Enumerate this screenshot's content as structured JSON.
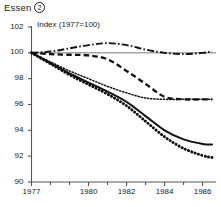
{
  "header": {
    "title": "Essen",
    "marker": "2"
  },
  "axis_note": "Index (1977=100)",
  "chart_data": {
    "type": "line",
    "title": "Essen",
    "subtitle": "Index (1977=100)",
    "xlabel": "",
    "ylabel": "Index (1977=100)",
    "xlim": [
      1977,
      1986.6
    ],
    "ylim": [
      90,
      102
    ],
    "yticks": [
      90,
      92,
      94,
      96,
      98,
      100,
      102
    ],
    "ytick_labels": [
      "90",
      "92",
      "94",
      "96",
      "98",
      "100",
      "102"
    ],
    "xticks": [
      1977,
      1978,
      1979,
      1980,
      1981,
      1982,
      1983,
      1984,
      1985,
      1986
    ],
    "xtick_labels": [
      "1977",
      "",
      "",
      "1980",
      "",
      "1982",
      "",
      "1984",
      "",
      "1986"
    ],
    "grid": false,
    "legend": "none",
    "reference_line": 100,
    "x": [
      1977,
      1978,
      1979,
      1980,
      1981,
      1982,
      1983,
      1984,
      1985,
      1986,
      1986.5
    ],
    "series": [
      {
        "name": "series-dash-dot",
        "style": "dash-dot",
        "values": [
          100.0,
          100.1,
          100.35,
          100.6,
          100.75,
          100.6,
          100.25,
          100.0,
          99.9,
          100.0,
          100.1
        ]
      },
      {
        "name": "series-dashed",
        "style": "dashed",
        "values": [
          100.0,
          99.9,
          99.85,
          99.8,
          99.5,
          98.6,
          97.6,
          96.6,
          96.4,
          96.4,
          96.4
        ]
      },
      {
        "name": "series-dotted-thin",
        "style": "dotted-thin",
        "values": [
          100.0,
          99.3,
          98.6,
          98.0,
          97.4,
          96.9,
          96.5,
          96.4,
          96.4,
          96.4,
          96.4
        ]
      },
      {
        "name": "series-solid",
        "style": "solid",
        "values": [
          100.0,
          99.2,
          98.4,
          97.7,
          97.0,
          96.2,
          95.1,
          94.0,
          93.3,
          92.95,
          92.9
        ]
      },
      {
        "name": "series-dotted-thick",
        "style": "dotted-thick",
        "values": [
          100.0,
          99.15,
          98.3,
          97.55,
          96.8,
          95.9,
          94.7,
          93.5,
          92.6,
          92.05,
          91.9
        ]
      }
    ]
  },
  "colors": {
    "line": "#111111",
    "axis": "#555555",
    "background": "#ffffff"
  }
}
